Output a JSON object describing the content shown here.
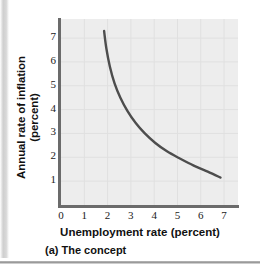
{
  "figure": {
    "caption": "(a) The concept"
  },
  "chart_data": {
    "type": "line",
    "title": "",
    "subtitle": "",
    "xlabel": "Unemployment rate (percent)",
    "ylabel": "Annual rate of inflation (percent)",
    "ylabel_line1": "Annual rate of inflation",
    "ylabel_line2": "(percent)",
    "xlim": [
      0,
      7.6
    ],
    "ylim": [
      0,
      7.8
    ],
    "xticks": [
      0,
      1,
      2,
      3,
      4,
      5,
      6,
      7
    ],
    "xtick_labels": [
      "0",
      "1",
      "2",
      "3",
      "4",
      "5",
      "6",
      "7"
    ],
    "yticks": [
      1,
      2,
      3,
      4,
      5,
      6,
      7
    ],
    "ytick_labels": [
      "1",
      "2",
      "3",
      "4",
      "5",
      "6",
      "7"
    ],
    "grid": true,
    "legend": false,
    "legend_position": "none",
    "series": [
      {
        "name": "Phillips curve",
        "color": "#4d4d4d",
        "line_width": 2.4,
        "x": [
          1.85,
          1.95,
          2.1,
          2.3,
          2.55,
          2.85,
          3.2,
          3.6,
          4.05,
          4.55,
          5.1,
          5.7,
          6.3,
          6.85
        ],
        "y": [
          7.3,
          6.55,
          5.8,
          5.1,
          4.5,
          3.95,
          3.45,
          3.0,
          2.6,
          2.25,
          1.95,
          1.65,
          1.4,
          1.15
        ]
      }
    ],
    "annotations": []
  },
  "colors": {
    "panel_background": "#ededed",
    "gridline": "#e0e0e0",
    "axis": "#6b6b6b",
    "curve": "#4d4d4d",
    "text": "#111111",
    "page_background": "#ffffff"
  }
}
